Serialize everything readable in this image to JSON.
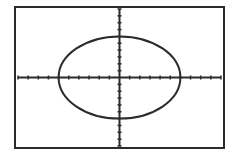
{
  "screen": {
    "frame": {
      "x": 15,
      "y": 7,
      "width": 209,
      "height": 141
    },
    "colors": {
      "background": "#ffffff",
      "ink": "#2b2b2b"
    }
  },
  "chart_data": {
    "type": "line",
    "title": "",
    "xlabel": "",
    "ylabel": "",
    "equation": "x^2 + y^2 = 36",
    "xlim": [
      -10,
      10
    ],
    "ylim": [
      -10,
      10
    ],
    "xscl": 1,
    "yscl": 1,
    "grid": false,
    "legend": null,
    "series": [
      {
        "name": "circle",
        "center": [
          0,
          0
        ],
        "rx": 6,
        "ry": 6,
        "x_intercepts": [
          -6,
          6
        ],
        "y_intercepts": [
          -6,
          6
        ]
      }
    ]
  }
}
